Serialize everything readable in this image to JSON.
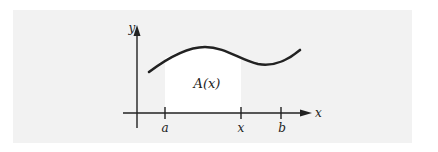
{
  "figure": {
    "background_color": "#ffffff",
    "panel_color": "#f2f2f2",
    "shaded_region_color": "#ffffff",
    "curve_color": "#222222",
    "axis_color": "#222222",
    "axes": {
      "x_label": "x",
      "y_label": "y"
    },
    "ticks": [
      {
        "label": "a"
      },
      {
        "label": "x"
      },
      {
        "label": "b"
      }
    ],
    "region_label": "A(x)"
  }
}
